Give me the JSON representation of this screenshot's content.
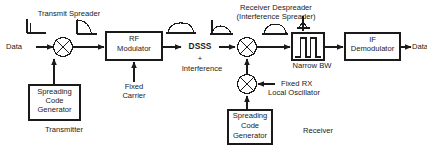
{
  "diagram": {
    "line_color": "#1a1a1a",
    "text_color": "#1a1a1a",
    "background": "#ffffff"
  },
  "transmitter": {
    "section_label": "Transmitter",
    "spreader_label": "Transmit Spreader",
    "input_label": "Data",
    "mixer_name": "spreading-mixer",
    "modulator_label_line1": "RF",
    "modulator_label_line2": "Modulator",
    "carrier_label_line1": "Fixed",
    "carrier_label_line2": "Carrier",
    "code_gen_line1": "Spreading",
    "code_gen_line2": "Code",
    "code_gen_line3": "Generator"
  },
  "channel": {
    "signal_label": "DSSS",
    "plus_label": "+",
    "interference_label": "Interference"
  },
  "receiver": {
    "section_label": "Receiver",
    "despreader_line1": "Receiver Despreader",
    "despreader_line2": "(Interference Spreader)",
    "mixer_name": "despreading-mixer",
    "filter_label": "Narrow BW",
    "lo_line1": "Fixed RX",
    "lo_line2": "Local Oscillator",
    "demod_line1": "IF",
    "demod_line2": "Demodulator",
    "output_label": "Data",
    "code_gen_line1": "Spreading",
    "code_gen_line2": "Code",
    "code_gen_line3": "Generator"
  },
  "spectra": {
    "narrowband_data": "narrow-spike-spectrum",
    "spreading_code": "wide-rolloff-spectrum",
    "dsss_rf": "wide-dome-spectrum",
    "received_composite": "dome-with-interference-spike-spectrum",
    "despread_wide": "wide-dome-spectrum",
    "filtered_narrow": "narrow-spike-with-lobes-spectrum",
    "filter_response": "bandpass-pulse-shape"
  }
}
